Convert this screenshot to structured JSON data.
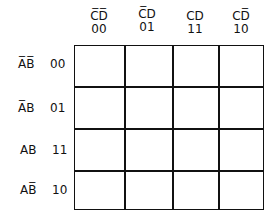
{
  "columns": [
    {
      "var": "C̅D̅",
      "code": "00"
    },
    {
      "var": "C̅D",
      "code": "01"
    },
    {
      "var": "CD",
      "code": "11"
    },
    {
      "var": "CD̅",
      "code": "10"
    }
  ],
  "rows": [
    {
      "var": "A̅B̅",
      "code": "00"
    },
    {
      "var": "A̅B",
      "code": "01"
    },
    {
      "var": "AB",
      "code": "11"
    },
    {
      "var": "AB̅",
      "code": "10"
    }
  ],
  "cells": [
    [
      "",
      "",
      "",
      ""
    ],
    [
      "",
      "",
      "",
      ""
    ],
    [
      "",
      "",
      "",
      ""
    ],
    [
      "",
      "",
      "",
      ""
    ]
  ]
}
